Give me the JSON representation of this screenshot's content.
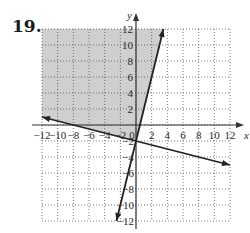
{
  "problem": {
    "number": "19."
  },
  "chart_data": {
    "type": "line",
    "title": "",
    "xlabel": "x",
    "ylabel": "y",
    "xlim": [
      -12,
      12
    ],
    "ylim": [
      -12,
      12
    ],
    "grid": true,
    "grid_style": "dotted",
    "x_ticks": [
      -12,
      -10,
      -8,
      -6,
      -4,
      -2,
      0,
      2,
      4,
      6,
      8,
      10,
      12
    ],
    "y_ticks": [
      -12,
      -10,
      -8,
      -6,
      -4,
      -2,
      2,
      4,
      6,
      8,
      10,
      12
    ],
    "x_tick_labels": [
      "−12",
      "−10",
      "−8",
      "−6",
      "−4",
      "−2",
      "0",
      "2",
      "4",
      "6",
      "8",
      "10",
      "12"
    ],
    "y_tick_labels_pos": [
      "2",
      "4",
      "6",
      "8",
      "10",
      "12"
    ],
    "y_tick_labels_neg": [
      "−2",
      "−4",
      "−6",
      "−8",
      "−10",
      "−12"
    ],
    "series": [
      {
        "name": "Line 1 (steep)",
        "equation": "y = 4x - 2",
        "points": [
          [
            -2.5,
            -12
          ],
          [
            3.5,
            12
          ]
        ]
      },
      {
        "name": "Line 2 (shallow)",
        "equation": "y = -x/4 - 2",
        "points": [
          [
            -12,
            1
          ],
          [
            12,
            -5
          ]
        ]
      }
    ],
    "shaded_region": {
      "description": "Region above y = -x/4 - 2 and to the left of y = 4x - 2",
      "inequalities": [
        "y >= -x/4 - 2",
        "y >= 4x - 2"
      ],
      "color": "#cfcfcf"
    },
    "intersection": [
      0,
      -2
    ]
  }
}
